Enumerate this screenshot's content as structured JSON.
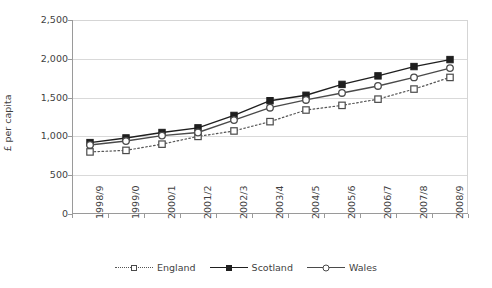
{
  "chart_data": {
    "type": "line",
    "title": "",
    "xlabel": "",
    "ylabel": "£ per capita",
    "ylim": [
      0,
      2500
    ],
    "yticks": [
      0,
      500,
      1000,
      1500,
      2000,
      2500
    ],
    "ytick_labels": [
      "0",
      "500",
      "1,000",
      "1,500",
      "2,000",
      "2,500"
    ],
    "grid": true,
    "legend_position": "bottom",
    "categories": [
      "1998/9",
      "1999/0",
      "2000/1",
      "2001/2",
      "2002/3",
      "2003/4",
      "2004/5",
      "2005/6",
      "2006/7",
      "2007/8",
      "2008/9"
    ],
    "series": [
      {
        "name": "England",
        "marker": "open-square",
        "line_style": "dotted",
        "color": "#555555",
        "values": [
          800,
          820,
          900,
          1000,
          1070,
          1190,
          1340,
          1400,
          1480,
          1610,
          1760
        ]
      },
      {
        "name": "Scotland",
        "marker": "filled-square",
        "line_style": "solid",
        "color": "#1f1f1f",
        "values": [
          920,
          980,
          1050,
          1110,
          1270,
          1460,
          1530,
          1670,
          1780,
          1900,
          1990
        ]
      },
      {
        "name": "Wales",
        "marker": "open-circle",
        "line_style": "solid",
        "color": "#4a4a4a",
        "values": [
          890,
          940,
          1010,
          1050,
          1210,
          1370,
          1470,
          1560,
          1650,
          1760,
          1880
        ]
      }
    ]
  },
  "axis": {
    "y_title": "£ per capita"
  },
  "legend": {
    "items": [
      {
        "label": "England"
      },
      {
        "label": "Scotland"
      },
      {
        "label": "Wales"
      }
    ]
  },
  "ghost_header": ""
}
